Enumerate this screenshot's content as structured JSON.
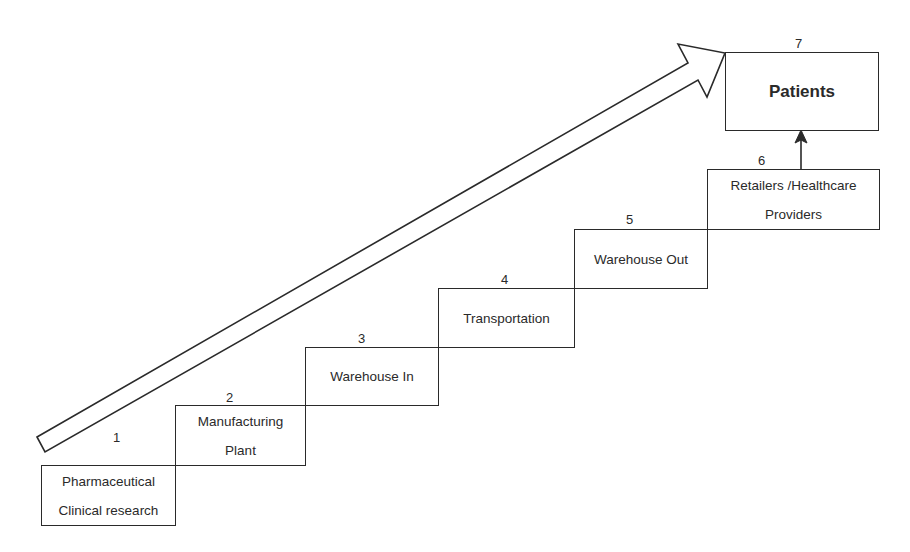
{
  "diagram": {
    "type": "staircase-flow",
    "steps": [
      {
        "number": "1",
        "lines": [
          "Pharmaceutical",
          "Clinical research"
        ]
      },
      {
        "number": "2",
        "lines": [
          "Manufacturing",
          "Plant"
        ]
      },
      {
        "number": "3",
        "lines": [
          "Warehouse In"
        ]
      },
      {
        "number": "4",
        "lines": [
          "Transportation"
        ]
      },
      {
        "number": "5",
        "lines": [
          "Warehouse Out"
        ]
      },
      {
        "number": "6",
        "lines": [
          "Retailers /Healthcare",
          "Providers"
        ]
      },
      {
        "number": "7",
        "lines": [
          "Patients"
        ]
      }
    ],
    "connectors": [
      {
        "from": "6",
        "to": "7",
        "type": "arrow-up"
      },
      {
        "from": "1",
        "to": "7",
        "type": "large-hollow-diagonal-arrow"
      }
    ],
    "colors": {
      "stroke": "#2a2a2a",
      "background": "#ffffff"
    }
  }
}
